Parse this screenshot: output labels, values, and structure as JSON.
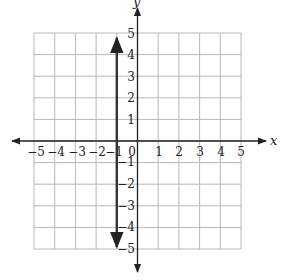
{
  "graph": {
    "x_axis_label": "x",
    "y_axis_label": "y",
    "x_ticks": [
      "−5",
      "−4",
      "−3",
      "−2",
      "−1",
      "0",
      "1",
      "2",
      "3",
      "4",
      "5"
    ],
    "y_ticks_positive": [
      "1",
      "2",
      "3",
      "4",
      "5"
    ],
    "y_ticks_negative": [
      "−1",
      "−2",
      "−3",
      "−4",
      "−5"
    ],
    "grid_range": {
      "x": [
        -5,
        5
      ],
      "y": [
        -5,
        5
      ]
    },
    "plotted_line": {
      "equation": "x = -1",
      "type": "vertical line with arrows at both ends"
    },
    "colors": {
      "grid": "#b8b8b8",
      "axes": "#222222",
      "line": "#333333"
    }
  }
}
